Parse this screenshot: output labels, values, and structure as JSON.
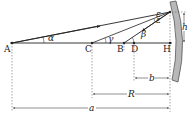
{
  "diagram": {
    "type": "spherical mirror ray geometry",
    "points": [
      {
        "id": "A",
        "label": "A"
      },
      {
        "id": "C",
        "label": "C"
      },
      {
        "id": "B",
        "label": "B"
      },
      {
        "id": "D",
        "label": "D"
      },
      {
        "id": "H",
        "label": "H"
      }
    ],
    "angles": {
      "alpha": "α",
      "gamma": "γ",
      "beta": "β",
      "epsilon": "ε"
    },
    "dimensions": {
      "h": "h",
      "b": "b",
      "R": "R",
      "a": "a"
    },
    "colors": {
      "line": "#222222",
      "mirror_fill": "#b8b8b8",
      "mirror_stroke": "#555555",
      "dashed": "#666666"
    }
  }
}
